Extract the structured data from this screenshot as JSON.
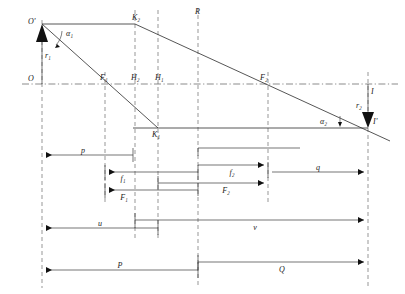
{
  "figure": {
    "type": "technical-line-diagram"
  },
  "points": {
    "object_top": "O'",
    "object_axis": "O",
    "image_top": "I",
    "image_axis": "I'",
    "ray_node_upper": "K₂",
    "ray_node_lower": "K₁",
    "focal_front": "F₁",
    "focal_back": "F₂",
    "principal_second": "H₂",
    "principal_first": "H₁",
    "reference_plane": "R"
  },
  "heights": {
    "object_height": "r₁",
    "image_height": "r₂"
  },
  "angles": {
    "object_angle": "α₁",
    "image_angle": "α₂"
  },
  "dimensions": [
    {
      "key": "p",
      "label": "p",
      "row": 1,
      "x1": 42,
      "x2": 133,
      "arrow": "left"
    },
    {
      "key": "f1",
      "label": "f₁",
      "row": 2,
      "x1": 105,
      "x2": 158,
      "arrow": "left"
    },
    {
      "key": "f2",
      "label": "f₂",
      "row": 2,
      "x1": 198,
      "x2": 268,
      "arrow": "right"
    },
    {
      "key": "q",
      "label": "q",
      "row": 3,
      "x1": 268,
      "x2": 368,
      "arrow": "right"
    },
    {
      "key": "F1",
      "label": "F₁",
      "row": 4,
      "x1": 105,
      "x2": 198,
      "arrow": "left"
    },
    {
      "key": "F2",
      "label": "F₂",
      "row": 4,
      "x1": 158,
      "x2": 268,
      "arrow": "right"
    },
    {
      "key": "u",
      "label": "u",
      "row": 5,
      "x1": 42,
      "x2": 158,
      "arrow": "left"
    },
    {
      "key": "v",
      "label": "v",
      "row": 5,
      "x1": 135,
      "x2": 368,
      "arrow": "right"
    },
    {
      "key": "P",
      "label": "P",
      "row": 6,
      "x1": 42,
      "x2": 198,
      "arrow": "left"
    },
    {
      "key": "Q",
      "label": "Q",
      "row": 6,
      "x1": 198,
      "x2": 368,
      "arrow": "right"
    }
  ],
  "vertical_planes": [
    {
      "name": "object-plane",
      "label": "O",
      "x": 42
    },
    {
      "name": "front-focal",
      "label": "F₁",
      "x": 105
    },
    {
      "name": "principal-H2",
      "label": "H₂",
      "x": 135
    },
    {
      "name": "principal-H1",
      "label": "H₁",
      "x": 158
    },
    {
      "name": "reference-R",
      "label": "R",
      "x": 198
    },
    {
      "name": "back-focal",
      "label": "F₂",
      "x": 268
    },
    {
      "name": "image-plane",
      "label": "I",
      "x": 368
    }
  ],
  "colors": {
    "line": "#3a3a3a",
    "ray": "#2b2b2b",
    "dashed": "#6b6b6b",
    "axis": "#5a5a5a",
    "arrowhead": "#111111",
    "background": "#ffffff"
  }
}
